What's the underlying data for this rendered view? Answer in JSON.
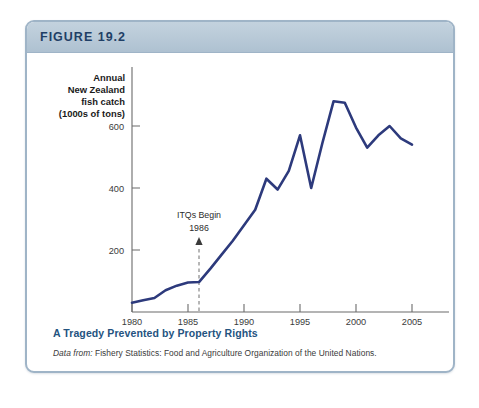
{
  "figure": {
    "label": "FIGURE 19.2",
    "caption_title": "A Tragedy Prevented by Property Rights",
    "source_lead": "Data from:",
    "source_text": "Fishery Statistics: Food and Agriculture Organization of the United Nations."
  },
  "colors": {
    "line": "#2d3a7c",
    "header_band": "#b8c9d7",
    "border": "#9fb4c7",
    "caption_title": "#24537f",
    "figure_label": "#1f3f66",
    "axis": "#6b6b6b"
  },
  "chart_data": {
    "type": "line",
    "title": "",
    "xlabel": "Year",
    "ylabel_lines": [
      "Annual",
      "New Zealand",
      "fish catch",
      "(1000s of tons)"
    ],
    "ylabel": "Annual New Zealand fish catch (1000s of tons)",
    "xlim": [
      1979,
      2005.5
    ],
    "ylim": [
      0,
      700
    ],
    "xticks": [
      1980,
      1985,
      1990,
      1995,
      2000,
      2005
    ],
    "xtick_labels": [
      "1980",
      "1985",
      "1990",
      "1995",
      "2000",
      "2005"
    ],
    "yticks": [
      200,
      400,
      600
    ],
    "ytick_labels": [
      "200",
      "400",
      "600"
    ],
    "grid": false,
    "legend": null,
    "series": [
      {
        "name": "Annual New Zealand fish catch",
        "color": "#2d3a7c",
        "x": [
          1980,
          1981,
          1982,
          1983,
          1984,
          1985,
          1986,
          1987,
          1988,
          1989,
          1990,
          1991,
          1992,
          1993,
          1994,
          1995,
          1996,
          1997,
          1998,
          1999,
          2000,
          2001,
          2002,
          2003,
          2004,
          2005
        ],
        "y": [
          30,
          38,
          45,
          70,
          85,
          95,
          97,
          140,
          185,
          230,
          280,
          330,
          430,
          395,
          455,
          570,
          400,
          545,
          680,
          675,
          595,
          530,
          570,
          600,
          560,
          540
        ]
      }
    ],
    "annotations": [
      {
        "name": "itq-annotation",
        "text_lines": [
          "ITQs Begin",
          "1986"
        ],
        "x": 1986,
        "marker": "dashed-vertical-line-with-arrow",
        "arrow_tip_y": 250,
        "line_top_y": 235,
        "line_bottom_y": 0
      }
    ]
  }
}
